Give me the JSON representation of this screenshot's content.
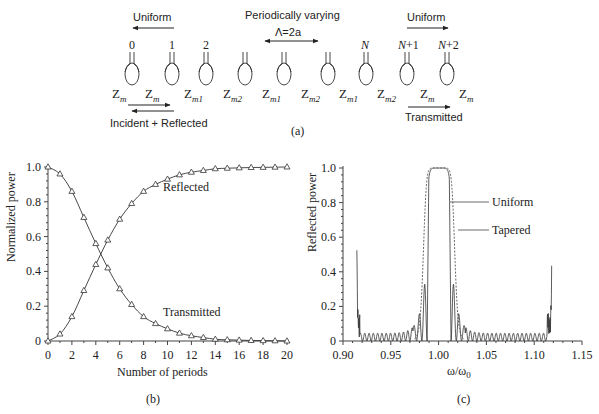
{
  "panel_a": {
    "caption": "(a)",
    "uniform_left_label": "Uniform",
    "uniform_right_label": "Uniform",
    "periodic_label": "Periodically varying",
    "period_label": "Λ=2a",
    "incident_label": "Incident + Reflected",
    "transmitted_label": "Transmitted",
    "resonator_labels": [
      "0",
      "1",
      "2",
      "",
      "",
      "",
      "",
      "N",
      "N+1",
      "N+2"
    ],
    "impedances": [
      {
        "base": "Z",
        "sub": "m"
      },
      {
        "base": "Z",
        "sub": "m"
      },
      {
        "base": "Z",
        "sub": "m1"
      },
      {
        "base": "Z",
        "sub": "m2"
      },
      {
        "base": "Z",
        "sub": "m1"
      },
      {
        "base": "Z",
        "sub": "m2"
      },
      {
        "base": "Z",
        "sub": "m1"
      },
      {
        "base": "Z",
        "sub": "m2"
      },
      {
        "base": "Z",
        "sub": "m"
      },
      {
        "base": "Z",
        "sub": "m"
      }
    ]
  },
  "panel_b": {
    "caption": "(b)",
    "ylabel": "Normalized power",
    "xlabel": "Number of periods",
    "yticks": [
      "0",
      "0.2",
      "0.4",
      "0.6",
      "0.8",
      "1.0"
    ],
    "xticks": [
      "0",
      "2",
      "4",
      "6",
      "8",
      "10",
      "12",
      "14",
      "16",
      "18",
      "20"
    ],
    "label_reflected": "Reflected",
    "label_transmitted": "Transmitted"
  },
  "panel_c": {
    "caption": "(c)",
    "ylabel": "Reflected power",
    "xlabel_main": "ω/ω",
    "xlabel_sub": "0",
    "yticks": [
      "0",
      "0.2",
      "0.4",
      "0.6",
      "0.8",
      "1.0"
    ],
    "xticks": [
      "0.90",
      "0.95",
      "1.00",
      "1.05",
      "1.10",
      "1.15"
    ],
    "label_uniform": "Uniform",
    "label_tapered": "Tapered"
  },
  "chart_data": [
    {
      "type": "line",
      "title": "(b)",
      "xlabel": "Number of periods",
      "ylabel": "Normalized power",
      "xlim": [
        0,
        20
      ],
      "ylim": [
        0,
        1.0
      ],
      "grid": false,
      "marker": "triangle",
      "x": [
        0,
        1,
        2,
        3,
        4,
        5,
        6,
        7,
        8,
        9,
        10,
        11,
        12,
        13,
        14,
        15,
        16,
        17,
        18,
        19,
        20
      ],
      "series": [
        {
          "name": "Reflected",
          "values": [
            0.0,
            0.04,
            0.14,
            0.29,
            0.44,
            0.58,
            0.7,
            0.79,
            0.86,
            0.9,
            0.93,
            0.955,
            0.97,
            0.98,
            0.99,
            0.993,
            0.995,
            0.997,
            0.998,
            0.999,
            1.0
          ]
        },
        {
          "name": "Transmitted",
          "values": [
            1.0,
            0.96,
            0.86,
            0.71,
            0.56,
            0.42,
            0.3,
            0.21,
            0.14,
            0.1,
            0.07,
            0.045,
            0.03,
            0.02,
            0.01,
            0.007,
            0.005,
            0.003,
            0.002,
            0.001,
            0.0
          ]
        }
      ]
    },
    {
      "type": "line",
      "title": "(c)",
      "xlabel": "ω/ω0",
      "ylabel": "Reflected power",
      "xlim": [
        0.9,
        1.15
      ],
      "ylim": [
        0,
        1.0
      ],
      "grid": false,
      "series": [
        {
          "name": "Uniform",
          "style": "solid",
          "description": "Flat-top stopband ~0.988–1.013 at 1.0; sidelobes 0.44 at 0.985 and 1.016, 0.22 at 0.980 and 1.022; ripples ~0.03–0.13 decaying outward; spikes ~0.47 near 0.915 and ~0.48 near 1.118",
          "x": [
            0.915,
            0.918,
            0.93,
            0.95,
            0.97,
            0.975,
            0.98,
            0.985,
            0.988,
            0.99,
            1.0,
            1.01,
            1.013,
            1.016,
            1.022,
            1.03,
            1.05,
            1.07,
            1.09,
            1.11,
            1.118
          ],
          "values": [
            0.47,
            0.18,
            0.05,
            0.05,
            0.09,
            0.13,
            0.22,
            0.44,
            0.0,
            1.0,
            1.0,
            1.0,
            0.0,
            0.44,
            0.22,
            0.13,
            0.06,
            0.05,
            0.05,
            0.12,
            0.48
          ]
        },
        {
          "name": "Tapered",
          "style": "dashed",
          "description": "Wider smooth stopband ~0.982–1.022 reaching 1.0 between ~0.99 and 1.01, decaying to ~0 by 0.98 / 1.03",
          "x": [
            0.975,
            0.98,
            0.985,
            0.99,
            0.995,
            1.0,
            1.005,
            1.01,
            1.015,
            1.02,
            1.025
          ],
          "values": [
            0.03,
            0.2,
            0.7,
            0.97,
            1.0,
            1.0,
            1.0,
            0.97,
            0.7,
            0.2,
            0.03
          ]
        }
      ]
    }
  ]
}
